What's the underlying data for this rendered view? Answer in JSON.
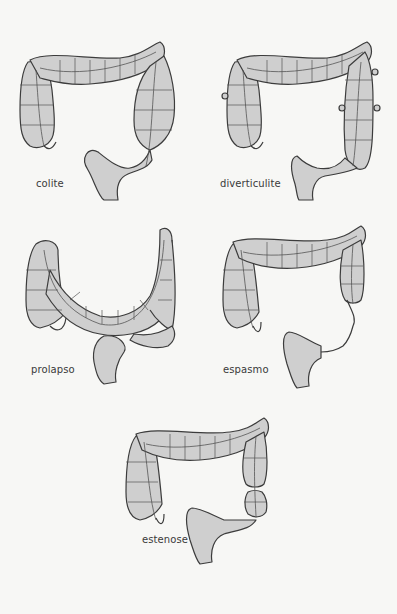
{
  "figure": {
    "panels": [
      {
        "id": "colite",
        "label": "colite"
      },
      {
        "id": "diverticulite",
        "label": "diverticulite"
      },
      {
        "id": "prolapso",
        "label": "prolapso"
      },
      {
        "id": "espasmo",
        "label": "espasmo"
      },
      {
        "id": "estenose",
        "label": "estenose"
      }
    ],
    "colors": {
      "background": "#f7f7f5",
      "organ_fill": "#cfcfcf",
      "outline": "#3c3c3c",
      "label_text": "#3a3a3a"
    }
  }
}
